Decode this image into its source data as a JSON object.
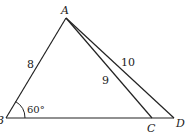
{
  "diagram": {
    "type": "triangle-geometry",
    "points": {
      "A": {
        "label": "A",
        "x": 66,
        "y": 18
      },
      "B": {
        "label": "B",
        "x": 6,
        "y": 118
      },
      "C": {
        "label": "C",
        "x": 152,
        "y": 118
      },
      "D": {
        "label": "D",
        "x": 174,
        "y": 118
      }
    },
    "segments": [
      {
        "from": "A",
        "to": "B",
        "length_label": "8"
      },
      {
        "from": "A",
        "to": "C",
        "length_label": "9"
      },
      {
        "from": "A",
        "to": "D",
        "length_label": "10"
      },
      {
        "from": "B",
        "to": "D",
        "length_label": ""
      }
    ],
    "angle": {
      "vertex": "B",
      "label": "60°"
    },
    "colors": {
      "stroke": "#222222",
      "background": "#ffffff"
    }
  }
}
